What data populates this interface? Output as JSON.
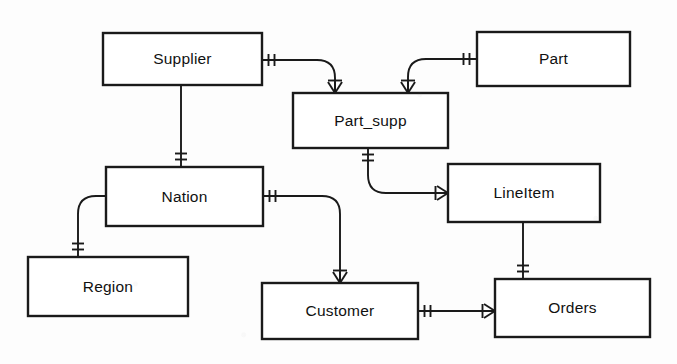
{
  "diagram": {
    "notation": "crow's foot",
    "background_color": "#fdfdfd",
    "line_color": "#1a1a1a",
    "box_fill": "#ffffff",
    "entities": [
      {
        "id": "supplier",
        "label": "Supplier",
        "x": 103,
        "y": 33,
        "w": 159,
        "h": 52
      },
      {
        "id": "part",
        "label": "Part",
        "x": 477,
        "y": 32,
        "w": 153,
        "h": 54
      },
      {
        "id": "part_supp",
        "label": "Part_supp",
        "x": 293,
        "y": 93,
        "w": 155,
        "h": 55
      },
      {
        "id": "nation",
        "label": "Nation",
        "x": 106,
        "y": 167,
        "w": 157,
        "h": 59
      },
      {
        "id": "lineitem",
        "label": "LineItem",
        "x": 448,
        "y": 164,
        "w": 152,
        "h": 58
      },
      {
        "id": "region",
        "label": "Region",
        "x": 28,
        "y": 257,
        "w": 160,
        "h": 59
      },
      {
        "id": "customer",
        "label": "Customer",
        "x": 262,
        "y": 283,
        "w": 156,
        "h": 56
      },
      {
        "id": "orders",
        "label": "Orders",
        "x": 495,
        "y": 279,
        "w": 155,
        "h": 58
      }
    ],
    "relationships": [
      {
        "id": "supplier-part_supp",
        "from": "Supplier",
        "to": "Part_supp",
        "from_cardinality": "one",
        "to_cardinality": "many",
        "path": "M262,60 L317,60 Q335,60 335,78 L335,93",
        "from_marker": {
          "type": "one",
          "x": 272,
          "y": 60,
          "orient": "h"
        },
        "to_marker": {
          "type": "many",
          "x": 335,
          "y": 93,
          "orient": "down"
        }
      },
      {
        "id": "part-part_supp",
        "from": "Part",
        "to": "Part_supp",
        "from_cardinality": "one",
        "to_cardinality": "many",
        "path": "M477,59 L426,59 Q408,59 408,77 L408,93",
        "from_marker": {
          "type": "one",
          "x": 467,
          "y": 59,
          "orient": "h"
        },
        "to_marker": {
          "type": "many",
          "x": 408,
          "y": 93,
          "orient": "down"
        }
      },
      {
        "id": "supplier-nation",
        "from": "Supplier",
        "to": "Nation",
        "from_cardinality": "many",
        "to_cardinality": "one",
        "path": "M181,85 L181,167",
        "from_marker": {
          "type": "many",
          "x": 181,
          "y": 85,
          "orient": "down"
        },
        "to_marker": {
          "type": "one",
          "x": 181,
          "y": 157,
          "orient": "v"
        }
      },
      {
        "id": "nation-region",
        "from": "Nation",
        "to": "Region",
        "from_cardinality": "many",
        "to_cardinality": "one",
        "path": "M106,196 L96,196 Q78,196 78,214 L78,257",
        "from_marker": {
          "type": "many",
          "x": 106,
          "y": 196,
          "orient": "left"
        },
        "to_marker": {
          "type": "one",
          "x": 78,
          "y": 247,
          "orient": "v"
        }
      },
      {
        "id": "nation-customer",
        "from": "Nation",
        "to": "Customer",
        "from_cardinality": "one",
        "to_cardinality": "many",
        "path": "M263,196 L322,196 Q340,196 340,214 L340,283",
        "from_marker": {
          "type": "one",
          "x": 273,
          "y": 196,
          "orient": "h"
        },
        "to_marker": {
          "type": "many",
          "x": 340,
          "y": 283,
          "orient": "down"
        }
      },
      {
        "id": "part_supp-lineitem",
        "from": "Part_supp",
        "to": "LineItem",
        "from_cardinality": "one",
        "to_cardinality": "many",
        "path": "M368,148 L368,175 Q368,193 386,193 L448,193",
        "from_marker": {
          "type": "one",
          "x": 368,
          "y": 158,
          "orient": "v"
        },
        "to_marker": {
          "type": "many",
          "x": 448,
          "y": 193,
          "orient": "right"
        }
      },
      {
        "id": "lineitem-orders",
        "from": "LineItem",
        "to": "Orders",
        "from_cardinality": "many",
        "to_cardinality": "one",
        "path": "M523,222 L523,279",
        "from_marker": {
          "type": "many",
          "x": 523,
          "y": 222,
          "orient": "down"
        },
        "to_marker": {
          "type": "one",
          "x": 523,
          "y": 269,
          "orient": "v"
        }
      },
      {
        "id": "customer-orders",
        "from": "Customer",
        "to": "Orders",
        "from_cardinality": "one",
        "to_cardinality": "many",
        "path": "M418,311 L495,311",
        "from_marker": {
          "type": "one",
          "x": 428,
          "y": 311,
          "orient": "h"
        },
        "to_marker": {
          "type": "many",
          "x": 495,
          "y": 311,
          "orient": "right"
        }
      }
    ]
  }
}
